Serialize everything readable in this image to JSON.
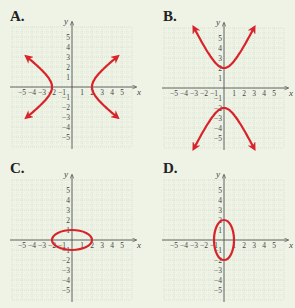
{
  "panels": [
    {
      "id": "A",
      "label": "A.",
      "ox": 72,
      "oy": 87,
      "lx": 10,
      "ly": 10
    },
    {
      "id": "B",
      "label": "B.",
      "ox": 224,
      "oy": 88,
      "lx": 163,
      "ly": 10
    },
    {
      "id": "C",
      "label": "C.",
      "ox": 72,
      "oy": 240,
      "lx": 10,
      "ly": 162
    },
    {
      "id": "D",
      "label": "D.",
      "ox": 224,
      "oy": 240,
      "lx": 163,
      "ly": 162
    }
  ],
  "axis": {
    "x_label": "x",
    "y_label": "y",
    "min": -5,
    "max": 5,
    "unit_px": 10,
    "x_ticks": [
      "-5",
      "-4",
      "-3",
      "-2",
      "-1",
      "1",
      "2",
      "3",
      "4",
      "5"
    ],
    "y_ticks": [
      "5",
      "4",
      "3",
      "2",
      "1",
      "-1",
      "-2",
      "-3",
      "-4",
      "-5"
    ]
  },
  "colors": {
    "background": "#eef3e6",
    "grid": "#cfd8c4",
    "axis": "#555555",
    "curve": "#d8232a"
  },
  "chart_data": [
    {
      "type": "line",
      "title": "A.",
      "description": "Horizontal hyperbola opening left/right, vertices at (-2,0) and (2,0)",
      "equation": "x^2/4 - y^2/4 = 1",
      "vertices": [
        [
          -2,
          0
        ],
        [
          2,
          0
        ]
      ],
      "arrow_endpoints": [
        [
          -6,
          3
        ],
        [
          -6,
          -3
        ],
        [
          6,
          3
        ],
        [
          6,
          -3
        ]
      ],
      "xlim": [
        -5,
        5
      ],
      "ylim": [
        -5,
        5
      ],
      "xlabel": "x",
      "ylabel": "y",
      "grid": true
    },
    {
      "type": "line",
      "title": "B.",
      "description": "Vertical hyperbola opening up/down, vertices at (0,2) and (0,-2)",
      "equation": "y^2/4 - x^2/2.25 = 1",
      "vertices": [
        [
          0,
          2
        ],
        [
          0,
          -2
        ]
      ],
      "arrow_endpoints": [
        [
          -3,
          6
        ],
        [
          3,
          6
        ],
        [
          -3,
          -6
        ],
        [
          3,
          -6
        ]
      ],
      "xlim": [
        -5,
        5
      ],
      "ylim": [
        -5,
        5
      ],
      "xlabel": "x",
      "ylabel": "y",
      "grid": true
    },
    {
      "type": "line",
      "title": "C.",
      "description": "Horizontal ellipse centered at origin",
      "equation": "x^2/4 + y^2/1 = 1",
      "semi_axes": {
        "a": 2,
        "b": 1
      },
      "center": [
        0,
        0
      ],
      "xlim": [
        -5,
        5
      ],
      "ylim": [
        -5,
        5
      ],
      "xlabel": "x",
      "ylabel": "y",
      "grid": true
    },
    {
      "type": "line",
      "title": "D.",
      "description": "Vertical ellipse centered at origin",
      "equation": "x^2/1 + y^2/4 = 1",
      "semi_axes": {
        "a": 1,
        "b": 2
      },
      "center": [
        0,
        0
      ],
      "xlim": [
        -5,
        5
      ],
      "ylim": [
        -5,
        5
      ],
      "xlabel": "x",
      "ylabel": "y",
      "grid": true
    }
  ]
}
